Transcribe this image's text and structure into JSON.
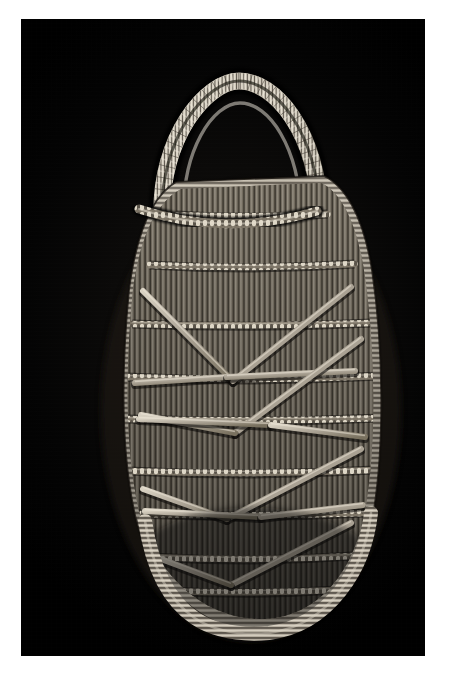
{
  "image": {
    "kind": "photograph",
    "subject": "woven-basket-cradle",
    "alt_text": "Oval woven basket with an arched wrapped handle, photographed against a black background",
    "border": {
      "color": "#ffffff",
      "left": 21,
      "top": 19,
      "right": 27,
      "bottom": 25
    },
    "plate": {
      "background_color": "#000000",
      "width": 404,
      "height": 637
    }
  },
  "palette": {
    "background": "#000000",
    "backdrop_glow": "#14120f",
    "fiber_light": "#d8d3c6",
    "fiber_mid": "#9b9386",
    "fiber_dark": "#4a453d",
    "fiber_shadow": "#241f1a",
    "rim_highlight": "#efe9dc",
    "strap_tone": "#b3aa9b",
    "frame": "#ffffff"
  },
  "object": {
    "name": "woven basket",
    "form": "oval body with arched carrying handle",
    "material": "split plant fiber / willow rods",
    "handle": {
      "label": "arched wrapped handle",
      "apex_y": 62,
      "span_left_x": 140,
      "span_right_x": 292,
      "wrap_count": 58
    },
    "rim": {
      "label": "coiled outer rim",
      "thickness": 13
    },
    "body": {
      "label": "vertical rod field",
      "warp_rod_count": 62,
      "twined_band_count": 9,
      "diagonal_lashing_count": 14
    },
    "base": {
      "label": "rounded wrapped base",
      "bottom_y": 612
    }
  },
  "geometry": {
    "outline_path": "M 112 270 C 104 352 104 430 118 492 C 134 556 182 598 236 600 C 292 602 332 558 344 492 C 356 424 354 330 344 258 C 336 200 318 172 300 164 L 300 164 L 160 170 C 138 182 120 212 112 270 Z",
    "rim_outer_path": "M 108 272 C 100 356 100 436 115 500 C 132 568 184 612 238 612 C 296 612 340 564 352 496 C 364 424 362 326 351 252 C 342 194 322 166 303 157 L 155 163 C 133 176 116 210 108 272 Z",
    "top_edge_path": "M 118 190 C 165 206 230 212 296 192",
    "handle_outer_path": "M 141 200 C 138 118 186 62 218 62 C 254 62 296 112 299 196",
    "handle_inner_path": "M 163 200 C 160 132 192 84 219 84 C 248 84 278 128 280 196"
  },
  "twined_bands": [
    {
      "y": 196,
      "label": "top twined band"
    },
    {
      "y": 246,
      "label": "twined band 2"
    },
    {
      "y": 305,
      "label": "twined band 3"
    },
    {
      "y": 358,
      "label": "twined band 4"
    },
    {
      "y": 400,
      "label": "twined band 5"
    },
    {
      "y": 452,
      "label": "twined band 6"
    },
    {
      "y": 495,
      "label": "twined band 7"
    },
    {
      "y": 538,
      "label": "twined band 8"
    },
    {
      "y": 572,
      "label": "twined band 9"
    }
  ],
  "lashings": [
    {
      "x1": 122,
      "y1": 272,
      "x2": 212,
      "y2": 362,
      "label": "lashing-1"
    },
    {
      "x1": 212,
      "y1": 362,
      "x2": 330,
      "y2": 268,
      "label": "lashing-2"
    },
    {
      "x1": 114,
      "y1": 364,
      "x2": 206,
      "y2": 358,
      "label": "lashing-3"
    },
    {
      "x1": 206,
      "y1": 358,
      "x2": 334,
      "y2": 352,
      "label": "lashing-4"
    },
    {
      "x1": 340,
      "y1": 320,
      "x2": 214,
      "y2": 414,
      "label": "lashing-5"
    },
    {
      "x1": 214,
      "y1": 414,
      "x2": 120,
      "y2": 396,
      "label": "lashing-6"
    },
    {
      "x1": 118,
      "y1": 400,
      "x2": 250,
      "y2": 406,
      "label": "lashing-7"
    },
    {
      "x1": 250,
      "y1": 406,
      "x2": 344,
      "y2": 418,
      "label": "lashing-8"
    },
    {
      "x1": 340,
      "y1": 430,
      "x2": 206,
      "y2": 500,
      "label": "lashing-9"
    },
    {
      "x1": 206,
      "y1": 500,
      "x2": 122,
      "y2": 470,
      "label": "lashing-10"
    },
    {
      "x1": 124,
      "y1": 492,
      "x2": 240,
      "y2": 498,
      "label": "lashing-11"
    },
    {
      "x1": 240,
      "y1": 498,
      "x2": 342,
      "y2": 486,
      "label": "lashing-12"
    },
    {
      "x1": 330,
      "y1": 504,
      "x2": 210,
      "y2": 566,
      "label": "lashing-13"
    },
    {
      "x1": 210,
      "y1": 566,
      "x2": 140,
      "y2": 540,
      "label": "lashing-14"
    }
  ]
}
